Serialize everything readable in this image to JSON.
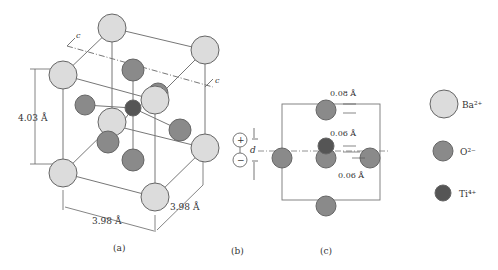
{
  "colors": {
    "ba": "#dcdcdc",
    "o": "#8a8a8a",
    "ti": "#555555",
    "stroke": "#666666",
    "line": "#777777"
  },
  "panel_a": {
    "label": "(a)",
    "height_dim": "4.03 Å",
    "width_dim": "3.98 Å",
    "depth_dim": "3.98 Å",
    "axis_label_1": "c",
    "axis_label_2": "c"
  },
  "panel_b": {
    "label": "(b)",
    "plus": "+",
    "minus": "−",
    "d_label": "d"
  },
  "panel_c": {
    "label": "(c)",
    "disp_top": "0.08 Å",
    "disp_ti": "0.06 Å",
    "disp_o": "0.06 Å"
  },
  "legend": {
    "items": [
      {
        "name": "Ba",
        "label": "Ba²⁺"
      },
      {
        "name": "O",
        "label": "O²⁻"
      },
      {
        "name": "Ti",
        "label": "Ti⁴⁺"
      }
    ]
  }
}
